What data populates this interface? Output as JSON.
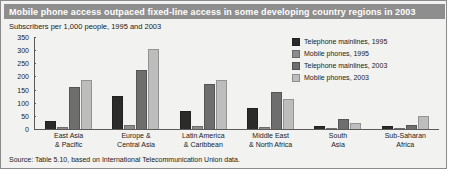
{
  "figure": {
    "title": "Mobile phone access outpaced fixed-line access in some developing country regions in 2003",
    "subtitle": "Subscribers per 1,000 people, 1995 and 2003",
    "source": "Source: Table 5.10, based on International Telecommunication Union data."
  },
  "colors": {
    "series_1": "#2b2b2b",
    "series_2": "#8c8c8c",
    "series_3": "#6e6e6e",
    "series_4": "#bdbdbd",
    "title_bar": "#8e8e8e",
    "axis": "#5a5a5a",
    "background": "#f2f2f0"
  },
  "chart_data": {
    "type": "bar",
    "title": "Mobile phone access outpaced fixed-line access in some developing country regions in 2003",
    "subtitle": "Subscribers per 1,000 people, 1995 and 2003",
    "xlabel": "",
    "ylabel": "Subscribers per 1,000 people",
    "ylim": [
      0,
      350
    ],
    "yticks": [
      0,
      50,
      100,
      150,
      200,
      250,
      300,
      350
    ],
    "grid": false,
    "legend_position": "top-right",
    "categories": [
      "East Asia & Pacific",
      "Europe & Central Asia",
      "Latin America & Caribbean",
      "Middle East & North Africa",
      "South Asia",
      "Sub-Saharan Africa"
    ],
    "category_lines": [
      [
        "East Asia",
        "& Pacific"
      ],
      [
        "Europe &",
        "Central Asia"
      ],
      [
        "Latin America",
        "& Caribbean"
      ],
      [
        "Middle East",
        "& North Africa"
      ],
      [
        "South",
        "Asia"
      ],
      [
        "Sub-Saharan",
        "Africa"
      ]
    ],
    "series": [
      {
        "name": "Telephone mainlines, 1995",
        "color": "#2b2b2b",
        "values": [
          30,
          125,
          70,
          80,
          13,
          10
        ]
      },
      {
        "name": "Mobile phones, 1995",
        "color": "#8c8c8c",
        "values": [
          8,
          17,
          12,
          8,
          1,
          1
        ]
      },
      {
        "name": "Telephone mainlines, 2003",
        "color": "#6e6e6e",
        "values": [
          160,
          225,
          170,
          140,
          40,
          15
        ]
      },
      {
        "name": "Mobile phones, 2003",
        "color": "#bdbdbd",
        "values": [
          185,
          305,
          185,
          115,
          22,
          50
        ]
      }
    ]
  },
  "legend": {
    "items": [
      {
        "label": "Telephone mainlines, 1995"
      },
      {
        "label": "Mobile phones, 1995"
      },
      {
        "label": "Telephone mainlines, 2003"
      },
      {
        "label": "Mobile phones, 2003"
      }
    ]
  }
}
